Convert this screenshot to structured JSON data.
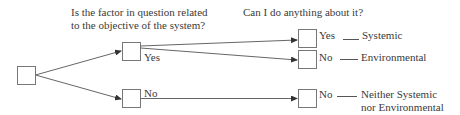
{
  "questions": {
    "q1_line1": "Is the factor in question related",
    "q1_line2": "to the objective of the system?",
    "q2": "Can I do anything about it?"
  },
  "branches": {
    "level1_yes": "Yes",
    "level1_no": "No",
    "level2_yes": "Yes",
    "level2_no": "No",
    "level2_no_bottom": "No"
  },
  "outcomes": {
    "systemic": "Systemic",
    "environmental": "Environmental",
    "neither_line1": "Neither Systemic",
    "neither_line2": "nor Environmental"
  },
  "colors": {
    "stroke": "#6b6b6b",
    "text": "#3a3a3a"
  }
}
